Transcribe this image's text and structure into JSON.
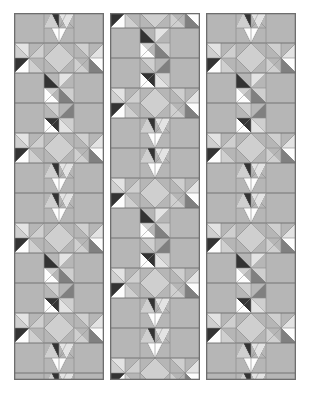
{
  "figure": {
    "kind": "three-panel pieced quilt schematic",
    "background_color": "#ffffff",
    "canvas": {
      "width": 310,
      "height": 394
    }
  },
  "palette": {
    "background": "#ffffff",
    "panel_border": "#6e6e6e",
    "grid_line": "#8c8c8c",
    "mid_gray": "#b6b6b6",
    "light_gray": "#cfcfcf",
    "pale_gray": "#e3e3e3",
    "white_patch": "#fdfdfd",
    "dark_gray": "#808080",
    "charcoal": "#4a4a4a",
    "near_black": "#333333"
  },
  "layout": {
    "cell_size": 30,
    "panel_columns": 3,
    "panel_rows": 12,
    "panels": [
      {
        "name": "left-panel",
        "x": 14,
        "y": 13,
        "width": 90,
        "height": 367,
        "row_offset": 0
      },
      {
        "name": "center-panel",
        "x": 110,
        "y": 13,
        "width": 90,
        "height": 367,
        "row_offset": 15
      },
      {
        "name": "right-panel",
        "x": 206,
        "y": 13,
        "width": 90,
        "height": 367,
        "row_offset": 0
      }
    ],
    "gap_between_panels": 6
  },
  "motifs": {
    "star_block_label": "eight-point star block",
    "pinwheel_label": "hourglass pinwheel unit",
    "hst_label": "half-square triangle",
    "qst_label": "quarter-square triangle"
  },
  "chart_data": {
    "type": "heatmap",
    "xlabel": "column",
    "ylabel": "row",
    "categories": [
      "col-0",
      "col-1",
      "col-2"
    ],
    "panels": [
      {
        "name": "left-panel",
        "cells": [
          [
            "plain",
            "star-top",
            "plain"
          ],
          [
            "star-left",
            "star-center",
            "star-right"
          ],
          [
            "plain",
            "pinwheel-a",
            "plain"
          ],
          [
            "plain",
            "pinwheel-b",
            "plain"
          ],
          [
            "star-left",
            "star-center",
            "star-right"
          ],
          [
            "plain",
            "star-top",
            "plain"
          ],
          [
            "plain",
            "star-top",
            "plain"
          ],
          [
            "star-left",
            "star-center",
            "star-right"
          ],
          [
            "plain",
            "pinwheel-a",
            "plain"
          ],
          [
            "plain",
            "pinwheel-b",
            "plain"
          ],
          [
            "star-left",
            "star-center",
            "star-right"
          ],
          [
            "plain",
            "star-top",
            "plain"
          ]
        ]
      },
      {
        "name": "center-panel",
        "cells": [
          [
            "star-left",
            "star-center",
            "star-right"
          ],
          [
            "plain",
            "pinwheel-a",
            "plain"
          ],
          [
            "plain",
            "pinwheel-b",
            "plain"
          ],
          [
            "star-left",
            "star-center",
            "star-right"
          ],
          [
            "plain",
            "star-top",
            "plain"
          ],
          [
            "plain",
            "star-top",
            "plain"
          ],
          [
            "star-left",
            "star-center",
            "star-right"
          ],
          [
            "plain",
            "pinwheel-a",
            "plain"
          ],
          [
            "plain",
            "pinwheel-b",
            "plain"
          ],
          [
            "star-left",
            "star-center",
            "star-right"
          ],
          [
            "plain",
            "star-top",
            "plain"
          ],
          [
            "plain",
            "star-top",
            "plain"
          ]
        ]
      },
      {
        "name": "right-panel",
        "cells": [
          [
            "plain",
            "star-top",
            "plain"
          ],
          [
            "star-left",
            "star-center",
            "star-right"
          ],
          [
            "plain",
            "pinwheel-a",
            "plain"
          ],
          [
            "plain",
            "pinwheel-b",
            "plain"
          ],
          [
            "star-left",
            "star-center",
            "star-right"
          ],
          [
            "plain",
            "star-top",
            "plain"
          ],
          [
            "plain",
            "star-top",
            "plain"
          ],
          [
            "star-left",
            "star-center",
            "star-right"
          ],
          [
            "plain",
            "pinwheel-a",
            "plain"
          ],
          [
            "plain",
            "pinwheel-b",
            "plain"
          ],
          [
            "star-left",
            "star-center",
            "star-right"
          ],
          [
            "plain",
            "star-top",
            "plain"
          ]
        ]
      }
    ]
  }
}
